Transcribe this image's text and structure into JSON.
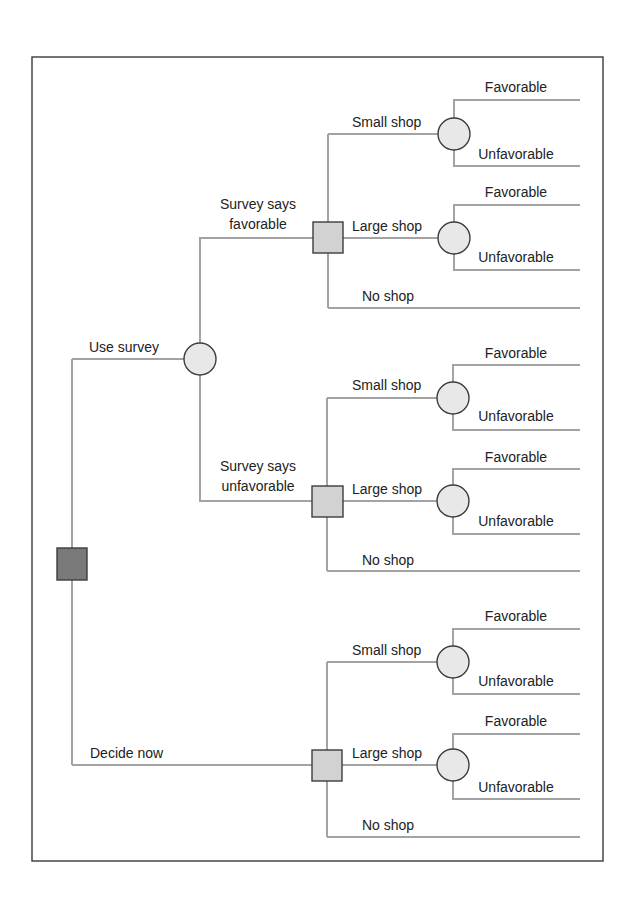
{
  "diagram": {
    "type": "decision-tree",
    "colors": {
      "frame": "#3a3a3a",
      "branch": "#a3a3a3",
      "root_decision_fill": "#7a7a7a",
      "decision_fill": "#d2d2d2",
      "chance_fill": "#e8e8e8",
      "node_stroke": "#3c3c3c",
      "text": "#222222"
    },
    "root": {
      "node": "decision",
      "branches": {
        "use_survey": "Use survey",
        "decide_now": "Decide now"
      }
    },
    "survey_outcomes": {
      "favorable_line1": "Survey says",
      "favorable_line2": "favorable",
      "unfavorable_line1": "Survey says",
      "unfavorable_line2": "unfavorable"
    },
    "groups": [
      {
        "context": "Survey says favorable",
        "small_shop": "Small shop",
        "large_shop": "Large shop",
        "no_shop": "No shop",
        "small_outcomes": [
          "Favorable",
          "Unfavorable"
        ],
        "large_outcomes": [
          "Favorable",
          "Unfavorable"
        ]
      },
      {
        "context": "Survey says unfavorable",
        "small_shop": "Small shop",
        "large_shop": "Large shop",
        "no_shop": "No shop",
        "small_outcomes": [
          "Favorable",
          "Unfavorable"
        ],
        "large_outcomes": [
          "Favorable",
          "Unfavorable"
        ]
      },
      {
        "context": "Decide now",
        "small_shop": "Small shop",
        "large_shop": "Large shop",
        "no_shop": "No shop",
        "small_outcomes": [
          "Favorable",
          "Unfavorable"
        ],
        "large_outcomes": [
          "Favorable",
          "Unfavorable"
        ]
      }
    ]
  }
}
